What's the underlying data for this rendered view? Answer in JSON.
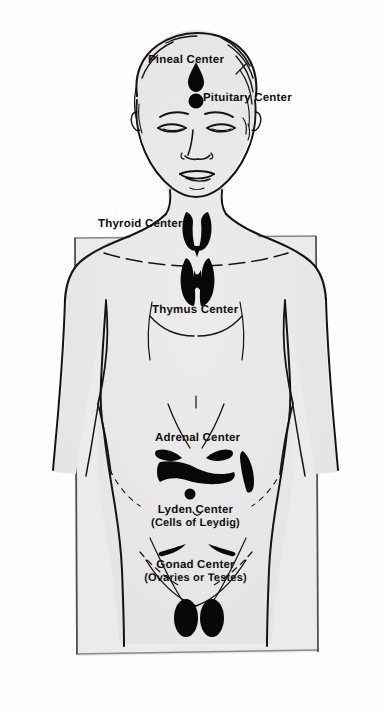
{
  "figure": {
    "background_color": "#fdfdfd",
    "body_fill_color": "#e9e9e9",
    "outline_color": "#141414",
    "gland_color": "#080808",
    "panel_border_color": "#1a1a1a",
    "text_color": "#101010"
  },
  "labels": {
    "pineal": "Pineal Center",
    "pituitary": "Pituitary Center",
    "thyroid": "Thyroid Center",
    "thymus": "Thymus Center",
    "adrenal": "Adrenal Center",
    "lyden": "Lyden Center",
    "lyden_sub": "(Cells of Leydig)",
    "gonad": "Gonad Center",
    "gonad_sub": "(Ovaries or Testes)"
  },
  "glands": [
    {
      "name": "pineal",
      "label": "Pineal Center",
      "shape": "teardrop",
      "x": 196,
      "y": 76
    },
    {
      "name": "pituitary",
      "label": "Pituitary Center",
      "shape": "dot",
      "x": 196,
      "y": 98
    },
    {
      "name": "thyroid",
      "label": "Thyroid Center",
      "shape": "butterfly",
      "x": 196,
      "y": 225
    },
    {
      "name": "thymus",
      "label": "Thymus Center",
      "shape": "lobed",
      "x": 196,
      "y": 272
    },
    {
      "name": "adrenal",
      "label": "Adrenal Center",
      "shape": "caps",
      "x": 196,
      "y": 468
    },
    {
      "name": "lyden",
      "label": "Lyden Center",
      "shape": "dot",
      "x": 190,
      "y": 494
    },
    {
      "name": "gonad",
      "label": "Gonad Center",
      "shape": "ovals",
      "x": 196,
      "y": 618
    }
  ]
}
